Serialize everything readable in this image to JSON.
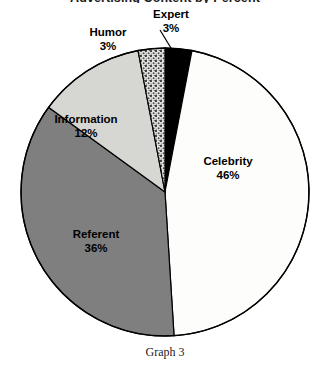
{
  "chart_data": {
    "type": "pie",
    "title": "Advertising Content by Percent",
    "caption": "Graph 3",
    "units": "%",
    "legend": "none",
    "grid": false,
    "labels_inside": true,
    "start_angle_deg": 0,
    "direction": "clockwise",
    "categories": [
      "Expert",
      "Celebrity",
      "Referent",
      "Information",
      "Humor"
    ],
    "values": [
      3,
      46,
      36,
      12,
      3
    ],
    "slices": [
      {
        "name": "Expert",
        "label": "Expert",
        "percent": 3,
        "percent_text": "3%",
        "color": "#000000",
        "fill_style": "solid",
        "label_position": "outside",
        "leader_line": true
      },
      {
        "name": "Celebrity",
        "label": "Celebrity",
        "percent": 46,
        "percent_text": "46%",
        "color": "#fdfdfb",
        "fill_style": "solid",
        "label_position": "inside",
        "leader_line": false
      },
      {
        "name": "Referent",
        "label": "Referent",
        "percent": 36,
        "percent_text": "36%",
        "color": "#7f7f7f",
        "fill_style": "solid",
        "label_position": "inside",
        "leader_line": false
      },
      {
        "name": "Information",
        "label": "Information",
        "percent": 12,
        "percent_text": "12%",
        "color": "#d6d6d2",
        "fill_style": "solid",
        "label_position": "inside",
        "leader_line": false
      },
      {
        "name": "Humor",
        "label": "Humor",
        "percent": 3,
        "percent_text": "3%",
        "color": "#cfcfcb",
        "fill_style": "stippled",
        "label_position": "outside",
        "leader_line": false
      }
    ],
    "xlabel": "",
    "ylabel": ""
  },
  "style": {
    "outline_color": "#000000",
    "background": "#ffffff",
    "text_color": "#000000"
  }
}
